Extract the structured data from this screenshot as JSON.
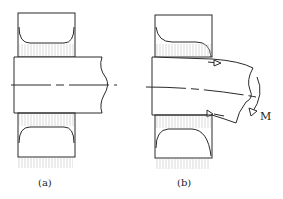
{
  "figure": {
    "panels": [
      {
        "id": "a",
        "label": "(a)",
        "description": "Shaft in bearing, no moment: uniform contact pressure"
      },
      {
        "id": "b",
        "label": "(b)",
        "description": "Shaft bent by moment M: edge-loaded contact pressure"
      }
    ],
    "moment_label": "M",
    "colors": {
      "line": "#2a2a2a",
      "hatch": "#c8c8c8",
      "background": "#ffffff"
    }
  }
}
